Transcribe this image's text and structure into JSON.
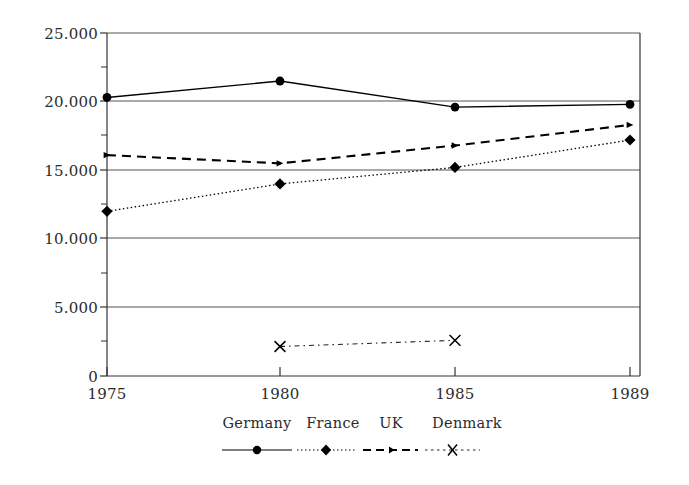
{
  "chart_data": {
    "type": "line",
    "title": "",
    "subtitle": "",
    "xlabel": "",
    "ylabel": "",
    "x": [
      "1975",
      "1980",
      "1985",
      "1989"
    ],
    "categories": [
      "1975",
      "1980",
      "1985",
      "1989"
    ],
    "xlim": [
      1975,
      1989
    ],
    "ylim": [
      0,
      25000
    ],
    "y_ticks": [
      0,
      5000,
      10000,
      15000,
      20000,
      25000
    ],
    "y_tick_labels": [
      "0",
      "5.000",
      "10.000",
      "15.000",
      "20.000",
      "25.000"
    ],
    "x_tick_labels": [
      "1975",
      "1980",
      "1985",
      "1989"
    ],
    "grid": "horizontal",
    "legend_position": "bottom",
    "series": [
      {
        "name": "Germany",
        "values": [
          20300,
          21500,
          19600,
          19800
        ],
        "marker": "filled-circle",
        "line_style": "solid",
        "color": "#000000"
      },
      {
        "name": "France",
        "values": [
          12000,
          14000,
          15200,
          17200
        ],
        "marker": "filled-diamond",
        "line_style": "dotted",
        "color": "#000000"
      },
      {
        "name": "UK",
        "values": [
          16100,
          15500,
          16800,
          18300
        ],
        "marker": "small-triangle",
        "line_style": "dashed",
        "color": "#000000"
      },
      {
        "name": "Denmark",
        "values": [
          null,
          2150,
          2600,
          null
        ],
        "marker": "cross-x",
        "line_style": "dash-dot",
        "color": "#000000"
      }
    ]
  },
  "legend": {
    "entries": [
      {
        "label": "Germany",
        "marker": "filled-circle",
        "line_style": "solid"
      },
      {
        "label": "France",
        "marker": "filled-diamond",
        "line_style": "dotted"
      },
      {
        "label": "UK",
        "marker": "small-triangle",
        "line_style": "dashed"
      },
      {
        "label": "Denmark",
        "marker": "cross-x",
        "line_style": "dash-dot"
      }
    ]
  },
  "axes": {
    "y_labels": [
      "25.000",
      "20.000",
      "15.000",
      "10.000",
      "5.000",
      "0"
    ],
    "x_labels": [
      "1975",
      "1980",
      "1985",
      "1989"
    ]
  },
  "colors": {
    "ink": "#000000",
    "grid": "#6b6b6b",
    "axis": "#4a4a4a",
    "background": "#ffffff"
  }
}
